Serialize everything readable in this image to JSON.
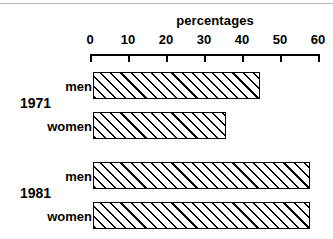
{
  "chart_data": {
    "type": "bar",
    "orientation": "horizontal",
    "title": "percentages",
    "xlabel": "percentages",
    "ylabel": "",
    "xlim": [
      0,
      60
    ],
    "xticks": [
      0,
      10,
      20,
      30,
      40,
      50,
      60
    ],
    "xtick_labels": [
      "0",
      "10",
      "20",
      "30",
      "40",
      "50",
      "60"
    ],
    "grid": false,
    "legend": false,
    "categories": [
      "1971 men",
      "1971 women",
      "1981 men",
      "1981 women"
    ],
    "values": [
      44,
      35,
      57,
      57
    ],
    "groups": [
      {
        "label": "1971",
        "bars": [
          {
            "label": "men",
            "value": 44
          },
          {
            "label": "women",
            "value": 35
          }
        ]
      },
      {
        "label": "1981",
        "bars": [
          {
            "label": "men",
            "value": 57
          },
          {
            "label": "women",
            "value": 57
          }
        ]
      }
    ],
    "bar_style": {
      "fill": "diagonal-hatch",
      "hatch_color": "#000000",
      "background": "#ffffff",
      "edge_color": "#000000"
    }
  },
  "axis": {
    "title": "percentages",
    "ticks": [
      {
        "label": "0",
        "value": 0
      },
      {
        "label": "10",
        "value": 10
      },
      {
        "label": "20",
        "value": 20
      },
      {
        "label": "30",
        "value": 30
      },
      {
        "label": "40",
        "value": 40
      },
      {
        "label": "50",
        "value": 50
      },
      {
        "label": "60",
        "value": 60
      }
    ]
  },
  "rows": [
    {
      "group": "1971",
      "label": "men",
      "value": 44
    },
    {
      "group": "1971",
      "label": "women",
      "value": 35
    },
    {
      "group": "1981",
      "label": "men",
      "value": 57
    },
    {
      "group": "1981",
      "label": "women",
      "value": 57
    }
  ],
  "group_labels": [
    {
      "label": "1971"
    },
    {
      "label": "1981"
    }
  ],
  "colors": {
    "ink": "#000000",
    "paper": "#ffffff",
    "rule": "#b9b9b9"
  }
}
